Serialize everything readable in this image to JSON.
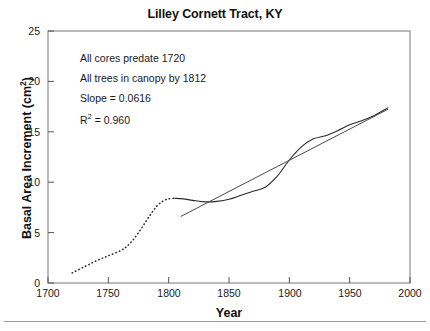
{
  "chart_data": {
    "type": "line",
    "title": "Lilley Cornett Tract, KY",
    "xlabel": "Year",
    "ylabel": "Basal Area Increment (cm2)",
    "ylabel_display": "Basal Area Increment (cm",
    "ylabel_sup": "2",
    "ylabel_tail": ")",
    "xlim": [
      1700,
      2000
    ],
    "ylim": [
      0,
      25
    ],
    "xticks": [
      1700,
      1750,
      1800,
      1850,
      1900,
      1950,
      2000
    ],
    "yticks": [
      0,
      5,
      10,
      15,
      20,
      25
    ],
    "xtick_labels": [
      "1700",
      "1750",
      "1800",
      "1850",
      "1900",
      "1950",
      "2000"
    ],
    "ytick_labels": [
      "0",
      "5",
      "10",
      "15",
      "20",
      "25"
    ],
    "grid": false,
    "legend": "none",
    "series": [
      {
        "name": "Basal area increment (pre-canopy, dotted)",
        "style": "dotted",
        "x": [
          1720,
          1730,
          1740,
          1750,
          1760,
          1765,
          1770,
          1775,
          1780,
          1785,
          1790,
          1795,
          1800,
          1805
        ],
        "y": [
          1.0,
          1.6,
          2.2,
          2.7,
          3.2,
          3.6,
          4.2,
          5.0,
          5.9,
          6.8,
          7.6,
          8.1,
          8.35,
          8.4
        ]
      },
      {
        "name": "Basal area increment (canopy, solid)",
        "style": "solid",
        "x": [
          1805,
          1812,
          1820,
          1830,
          1840,
          1850,
          1860,
          1870,
          1880,
          1890,
          1900,
          1910,
          1920,
          1930,
          1940,
          1950,
          1960,
          1970,
          1982
        ],
        "y": [
          8.4,
          8.35,
          8.2,
          8.05,
          8.1,
          8.3,
          8.7,
          9.1,
          9.5,
          10.6,
          12.2,
          13.5,
          14.3,
          14.6,
          15.1,
          15.7,
          16.1,
          16.6,
          17.4
        ]
      },
      {
        "name": "Linear regression",
        "style": "solid-straight",
        "x": [
          1810,
          1982
        ],
        "y": [
          6.6,
          17.25
        ]
      }
    ],
    "annotations": [
      {
        "text": "All cores predate 1720"
      },
      {
        "text": "All trees in canopy by 1812"
      },
      {
        "text": "Slope = 0.0616"
      },
      {
        "text": "R2 = 0.960",
        "prefix": "R",
        "sup": "2",
        "suffix": " = 0.960"
      }
    ],
    "colors": {
      "axis": "#555555",
      "curve": "#2a2a2a",
      "regression": "#4a4a4a",
      "text": "#1a1a1a",
      "background": "#ffffff"
    }
  }
}
